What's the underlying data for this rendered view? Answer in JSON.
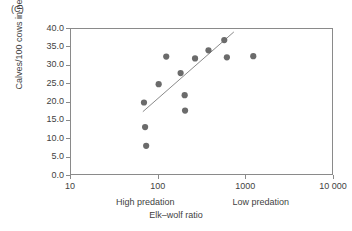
{
  "panel": {
    "label": "(C)"
  },
  "chart_data": {
    "type": "scatter",
    "title": "",
    "panel_label": "(C)",
    "xlabel": "Elk–wolf ratio",
    "ylabel": "Calves/100 cows in next year",
    "xscale": "log",
    "yscale": "linear",
    "xlim": [
      10,
      10000
    ],
    "ylim": [
      0.0,
      40.0
    ],
    "grid": false,
    "legend": false,
    "x_tick_labels": [
      "10",
      "100",
      "1000",
      "10 000"
    ],
    "x_tick_values": [
      10,
      100,
      1000,
      10000
    ],
    "y_tick_labels": [
      "0.0",
      "5.0",
      "10.0",
      "15.0",
      "20.0",
      "25.0",
      "30.0",
      "35.0",
      "40.0"
    ],
    "y_tick_values": [
      0.0,
      5.0,
      10.0,
      15.0,
      20.0,
      25.0,
      30.0,
      35.0,
      40.0
    ],
    "marker_color": "#6b6b6b",
    "marker_shape": "circle",
    "trendline_color": "#8a8a8a",
    "annotations": [
      {
        "text": "High predation",
        "x": 72,
        "align": "center"
      },
      {
        "text": "Low predation",
        "x": 1500,
        "align": "center"
      }
    ],
    "points": [
      {
        "x": 68,
        "y": 20.0
      },
      {
        "x": 70,
        "y": 13.3
      },
      {
        "x": 72,
        "y": 8.2
      },
      {
        "x": 100,
        "y": 25.0
      },
      {
        "x": 122,
        "y": 32.5
      },
      {
        "x": 178,
        "y": 28.0
      },
      {
        "x": 198,
        "y": 22.0
      },
      {
        "x": 200,
        "y": 17.8
      },
      {
        "x": 260,
        "y": 32.0
      },
      {
        "x": 370,
        "y": 34.2
      },
      {
        "x": 560,
        "y": 37.0
      },
      {
        "x": 600,
        "y": 32.3
      },
      {
        "x": 1200,
        "y": 32.6
      }
    ],
    "trendline": {
      "x_start": 66,
      "y_start": 17.5,
      "x_end": 720,
      "y_end": 39.2
    }
  }
}
